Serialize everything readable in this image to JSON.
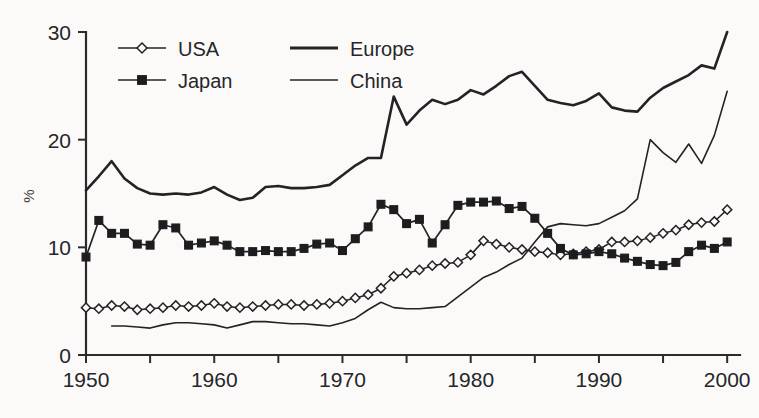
{
  "chart_data": {
    "type": "line",
    "title": "",
    "xlabel": "",
    "ylabel": "%",
    "xlim": [
      1950,
      2001
    ],
    "ylim": [
      0,
      30
    ],
    "grid": false,
    "legend_position": "top-left",
    "x_tick_labels": [
      "1950",
      "1960",
      "1970",
      "1980",
      "1990",
      "2000"
    ],
    "x_tick_values": [
      1950,
      1960,
      1970,
      1980,
      1990,
      2000
    ],
    "x_minor_tick_values": [
      1955,
      1965,
      1975,
      1985,
      1995
    ],
    "y_tick_labels": [
      "0",
      "10",
      "20",
      "30"
    ],
    "y_tick_values": [
      0,
      10,
      20,
      30
    ],
    "x": [
      1950,
      1951,
      1952,
      1953,
      1954,
      1955,
      1956,
      1957,
      1958,
      1959,
      1960,
      1961,
      1962,
      1963,
      1964,
      1965,
      1966,
      1967,
      1968,
      1969,
      1970,
      1971,
      1972,
      1973,
      1974,
      1975,
      1976,
      1977,
      1978,
      1979,
      1980,
      1981,
      1982,
      1983,
      1984,
      1985,
      1986,
      1987,
      1988,
      1989,
      1990,
      1991,
      1992,
      1993,
      1994,
      1995,
      1996,
      1997,
      1998,
      1999,
      2000
    ],
    "series": [
      {
        "name": "USA",
        "marker": "open-diamond",
        "line_style": "solid-thin",
        "values": [
          4.4,
          4.3,
          4.6,
          4.5,
          4.2,
          4.3,
          4.4,
          4.6,
          4.5,
          4.6,
          4.8,
          4.5,
          4.4,
          4.5,
          4.6,
          4.7,
          4.7,
          4.6,
          4.7,
          4.8,
          5.0,
          5.3,
          5.6,
          6.2,
          7.3,
          7.6,
          7.9,
          8.3,
          8.5,
          8.6,
          9.3,
          10.6,
          10.3,
          10.0,
          9.8,
          9.6,
          9.5,
          9.3,
          9.4,
          9.6,
          9.8,
          10.5,
          10.5,
          10.6,
          10.9,
          11.3,
          11.6,
          12.1,
          12.3,
          12.4,
          13.5
        ]
      },
      {
        "name": "Japan",
        "marker": "filled-square",
        "line_style": "solid-thin",
        "values": [
          9.1,
          12.5,
          11.3,
          11.3,
          10.3,
          10.2,
          12.1,
          11.8,
          10.2,
          10.4,
          10.6,
          10.2,
          9.6,
          9.6,
          9.7,
          9.6,
          9.6,
          9.9,
          10.3,
          10.4,
          9.7,
          10.8,
          11.9,
          14.0,
          13.5,
          12.2,
          12.6,
          10.4,
          12.1,
          13.9,
          14.2,
          14.2,
          14.3,
          13.6,
          13.8,
          12.7,
          11.3,
          9.9,
          9.3,
          9.4,
          9.6,
          9.4,
          9.0,
          8.7,
          8.4,
          8.3,
          8.6,
          9.6,
          10.2,
          9.9,
          10.5
        ]
      },
      {
        "name": "Europe",
        "marker": "none",
        "line_style": "solid-thick",
        "values": [
          15.3,
          16.6,
          18.0,
          16.4,
          15.5,
          15.0,
          14.9,
          15.0,
          14.9,
          15.1,
          15.6,
          14.9,
          14.4,
          14.6,
          15.6,
          15.7,
          15.5,
          15.5,
          15.6,
          15.8,
          16.7,
          17.6,
          18.3,
          18.3,
          24.0,
          21.4,
          22.7,
          23.7,
          23.3,
          23.7,
          24.6,
          24.2,
          25.0,
          25.9,
          26.3,
          25.0,
          23.7,
          23.4,
          23.2,
          23.6,
          24.3,
          23.0,
          22.7,
          22.6,
          23.9,
          24.8,
          25.4,
          26.0,
          26.9,
          26.6,
          30.0
        ]
      },
      {
        "name": "China",
        "marker": "none",
        "line_style": "solid-thin",
        "values": [
          null,
          null,
          2.7,
          2.7,
          2.6,
          2.5,
          2.8,
          3.0,
          3.0,
          2.9,
          2.8,
          2.5,
          2.8,
          3.1,
          3.1,
          3.0,
          2.9,
          2.9,
          2.8,
          2.7,
          3.0,
          3.4,
          4.2,
          4.9,
          4.4,
          4.3,
          4.3,
          4.4,
          4.5,
          5.4,
          6.3,
          7.2,
          7.7,
          8.4,
          9.0,
          10.5,
          11.9,
          12.2,
          12.1,
          12.0,
          12.2,
          12.8,
          13.4,
          14.5,
          20.0,
          18.8,
          17.9,
          19.6,
          17.8,
          20.4,
          24.5
        ]
      }
    ]
  },
  "legend": {
    "items": [
      {
        "label": "USA",
        "marker": "open-diamond",
        "style": "thin"
      },
      {
        "label": "Europe",
        "marker": "none",
        "style": "thick"
      },
      {
        "label": "Japan",
        "marker": "filled-square",
        "style": "thin"
      },
      {
        "label": "China",
        "marker": "none",
        "style": "thin"
      }
    ]
  },
  "axes": {
    "y_title": "%"
  },
  "colors": {
    "ink": "#232326",
    "background": "#fbfaf8"
  }
}
